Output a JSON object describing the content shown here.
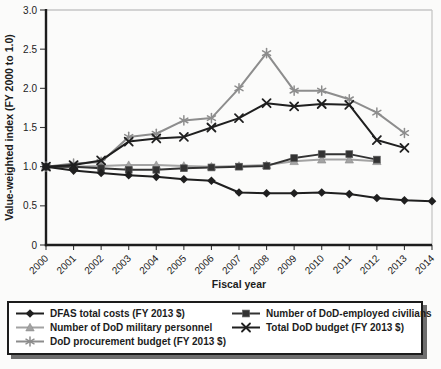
{
  "figure": {
    "background": "#fbfbfa",
    "axis_color": "#1c1c1c",
    "frame_color": "#c6c6c6",
    "tick_color": "#3a3a3a",
    "legend_border_color": "#1c1c1c",
    "legend_shadow_color": "#6e6e6e"
  },
  "chart_data": {
    "type": "line",
    "title": "",
    "xlabel": "Fiscal year",
    "ylabel": "Value-weighted index (FY 2000 to 1.0)",
    "ylim": [
      0,
      3.0
    ],
    "y_ticks": [
      0,
      0.5,
      1.0,
      1.5,
      2.0,
      2.5,
      3.0
    ],
    "y_tick_labels": [
      "0",
      "0.5",
      "1.0",
      "1.5",
      "2.0",
      "2.5",
      "3.0"
    ],
    "x_ticks": [
      2000,
      2001,
      2002,
      2003,
      2004,
      2005,
      2006,
      2007,
      2008,
      2009,
      2010,
      2011,
      2012,
      2013,
      2014
    ],
    "grid": false,
    "legend_position": "bottom",
    "draw_order": [
      2,
      4,
      1,
      3,
      0
    ],
    "series": [
      {
        "name": "DFAS total costs (FY 2013 $)",
        "marker": "diamond",
        "color": "#1f1f1f",
        "x": [
          2000,
          2001,
          2002,
          2003,
          2004,
          2005,
          2006,
          2007,
          2008,
          2009,
          2010,
          2011,
          2012,
          2013,
          2014
        ],
        "values": [
          1.0,
          0.95,
          0.92,
          0.89,
          0.87,
          0.84,
          0.82,
          0.67,
          0.66,
          0.66,
          0.67,
          0.65,
          0.6,
          0.57,
          0.56
        ]
      },
      {
        "name": "Number of DoD-employed civilians",
        "marker": "square",
        "color": "#333333",
        "x": [
          2000,
          2001,
          2002,
          2003,
          2004,
          2005,
          2006,
          2007,
          2008,
          2009,
          2010,
          2011,
          2012
        ],
        "values": [
          1.0,
          1.0,
          0.98,
          0.96,
          0.96,
          0.98,
          0.99,
          1.0,
          1.01,
          1.11,
          1.16,
          1.16,
          1.09
        ]
      },
      {
        "name": "Number of DoD military personnel",
        "marker": "triangle",
        "color": "#a3a3a3",
        "x": [
          2000,
          2001,
          2002,
          2003,
          2004,
          2005,
          2006,
          2007,
          2008,
          2009,
          2010,
          2011,
          2012
        ],
        "values": [
          1.0,
          1.0,
          1.01,
          1.02,
          1.02,
          1.01,
          1.0,
          1.01,
          1.02,
          1.07,
          1.09,
          1.09,
          1.07
        ]
      },
      {
        "name": "Total DoD budget (FY 2013 $)",
        "marker": "x",
        "color": "#1f1f1f",
        "x": [
          2000,
          2001,
          2002,
          2003,
          2004,
          2005,
          2006,
          2007,
          2008,
          2009,
          2010,
          2011,
          2012,
          2013
        ],
        "values": [
          1.0,
          1.02,
          1.08,
          1.32,
          1.36,
          1.38,
          1.5,
          1.62,
          1.81,
          1.77,
          1.8,
          1.79,
          1.34,
          1.24
        ]
      },
      {
        "name": "DoD procurement budget (FY 2013 $)",
        "marker": "asterisk",
        "color": "#8d8d8d",
        "x": [
          2000,
          2001,
          2002,
          2003,
          2004,
          2005,
          2006,
          2007,
          2008,
          2009,
          2010,
          2011,
          2012,
          2013
        ],
        "values": [
          1.0,
          1.04,
          1.06,
          1.38,
          1.42,
          1.59,
          1.62,
          2.0,
          2.45,
          1.97,
          1.97,
          1.86,
          1.69,
          1.43
        ]
      }
    ]
  }
}
